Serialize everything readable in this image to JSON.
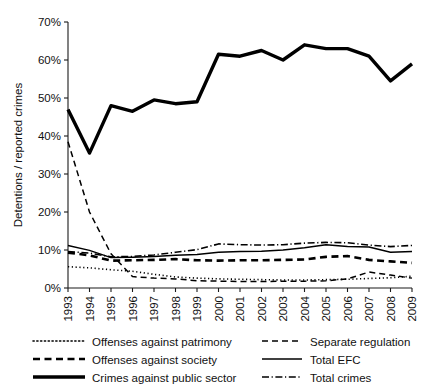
{
  "chart_data": {
    "type": "line",
    "title": "",
    "xlabel": "",
    "ylabel": "Detentions / reported crimes",
    "x": [
      1993,
      1994,
      1995,
      1996,
      1997,
      1998,
      1999,
      2000,
      2001,
      2002,
      2003,
      2004,
      2005,
      2006,
      2007,
      2008,
      2009
    ],
    "xtick_labels": [
      "1993",
      "1994",
      "1995",
      "1996",
      "1997",
      "1998",
      "1999",
      "2000",
      "2001",
      "2002",
      "2003",
      "2004",
      "2005",
      "2006",
      "2007",
      "2008",
      "2009"
    ],
    "ytick_labels": [
      "0%",
      "10%",
      "20%",
      "30%",
      "40%",
      "50%",
      "60%",
      "70%"
    ],
    "ytick_values": [
      0,
      10,
      20,
      30,
      40,
      50,
      60,
      70
    ],
    "ylim": [
      0,
      70
    ],
    "xlim": [
      1993,
      2009
    ],
    "grid": false,
    "legend_position": "below-axes",
    "series": [
      {
        "name": "Offenses against patrimony",
        "style": "dotted",
        "color": "#000000",
        "values": [
          5.6,
          5.3,
          4.8,
          4.4,
          3.6,
          2.9,
          2.6,
          2.4,
          2.3,
          2.2,
          2.1,
          2.1,
          2.2,
          2.3,
          2.5,
          2.7,
          3.1
        ]
      },
      {
        "name": "Separate regulation",
        "style": "dashed",
        "color": "#000000",
        "values": [
          38.5,
          20.0,
          9.0,
          3.0,
          2.6,
          2.4,
          1.9,
          1.8,
          1.7,
          1.7,
          1.8,
          1.8,
          1.9,
          2.4,
          4.2,
          3.4,
          2.6
        ]
      },
      {
        "name": "Offenses against society",
        "style": "dashed-medium",
        "color": "#000000",
        "values": [
          9.3,
          8.6,
          7.2,
          7.3,
          7.4,
          7.6,
          7.3,
          7.2,
          7.3,
          7.3,
          7.4,
          7.5,
          8.2,
          8.4,
          7.4,
          7.0,
          6.6
        ]
      },
      {
        "name": "Total EFC",
        "style": "solid-thin",
        "color": "#000000",
        "values": [
          11.2,
          9.9,
          8.0,
          8.1,
          8.3,
          8.6,
          8.8,
          9.4,
          9.6,
          9.7,
          10.0,
          10.6,
          11.4,
          10.9,
          10.8,
          9.4,
          9.6
        ]
      },
      {
        "name": "Crimes against public sector",
        "style": "solid-thick",
        "color": "#000000",
        "values": [
          47.0,
          35.5,
          48.0,
          46.5,
          49.5,
          48.5,
          49.0,
          61.5,
          61.0,
          62.5,
          60.0,
          64.0,
          63.0,
          63.0,
          61.0,
          54.5,
          59.0
        ]
      },
      {
        "name": "Total crimes",
        "style": "dash-dot",
        "color": "#000000",
        "values": [
          9.6,
          9.2,
          8.2,
          8.3,
          8.7,
          9.4,
          10.1,
          11.6,
          11.4,
          11.3,
          11.4,
          11.8,
          12.0,
          11.9,
          11.3,
          10.9,
          11.2
        ]
      }
    ]
  },
  "axes": {
    "y_axis_title": "Detentions / reported crimes"
  },
  "legend": {
    "entries": [
      {
        "label": "Offenses against patrimony",
        "style": "dotted"
      },
      {
        "label": "Separate regulation",
        "style": "dashed"
      },
      {
        "label": "Offenses against society",
        "style": "dashed-medium"
      },
      {
        "label": "Total EFC",
        "style": "solid-thin"
      },
      {
        "label": "Crimes against public sector",
        "style": "solid-thick"
      },
      {
        "label": "Total crimes",
        "style": "dash-dot"
      }
    ]
  }
}
